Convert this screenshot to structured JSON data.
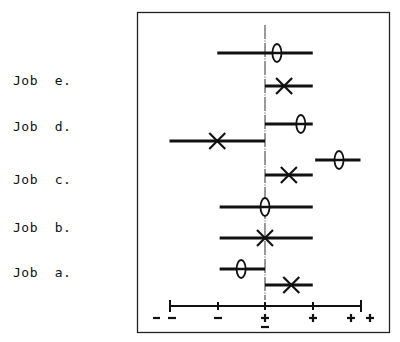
{
  "chart_data": {
    "type": "scatter",
    "title": "",
    "xlabel": "",
    "ylabel": "",
    "axis": {
      "ticks": [
        -2,
        -1,
        0,
        1,
        2
      ],
      "tick_labels": [
        "– –",
        "–",
        "±",
        "+",
        "+ +"
      ],
      "range": [
        -2,
        2
      ]
    },
    "grid": false,
    "legend": null,
    "categories": [
      "Job e.",
      "Job d.",
      "Job c.",
      "Job b.",
      "Job a."
    ],
    "series": [
      {
        "name": "theta (ellipse marker)",
        "marker": "theta",
        "points": [
          {
            "job": "Job e.",
            "value": 0.25,
            "low": -1.0,
            "high": 1.0
          },
          {
            "job": "Job d.",
            "value": 0.75,
            "low": 0.0,
            "high": 1.0
          },
          {
            "job": "Job c.",
            "value": 1.55,
            "low": 1.05,
            "high": 2.0
          },
          {
            "job": "Job b.",
            "value": 0.0,
            "low": -0.95,
            "high": 1.0
          },
          {
            "job": "Job a.",
            "value": -0.5,
            "low": -0.95,
            "high": 0.0
          }
        ]
      },
      {
        "name": "cross (X marker)",
        "marker": "x",
        "points": [
          {
            "job": "Job e.",
            "value": 0.4,
            "low": 0.0,
            "high": 1.0
          },
          {
            "job": "Job d.",
            "value": -1.0,
            "low": -2.0,
            "high": 0.0
          },
          {
            "job": "Job c.",
            "value": 0.5,
            "low": 0.0,
            "high": 1.0
          },
          {
            "job": "Job b.",
            "value": 0.0,
            "low": -0.95,
            "high": 1.0
          },
          {
            "job": "Job a.",
            "value": 0.55,
            "low": 0.0,
            "high": 1.0
          }
        ]
      }
    ]
  },
  "labels": {
    "job_e": "Job  e.",
    "job_d": "Job  d.",
    "job_c": "Job  c.",
    "job_b": "Job  b.",
    "job_a": "Job  a."
  },
  "colors": {
    "ink": "#111111",
    "background": "#ffffff"
  }
}
